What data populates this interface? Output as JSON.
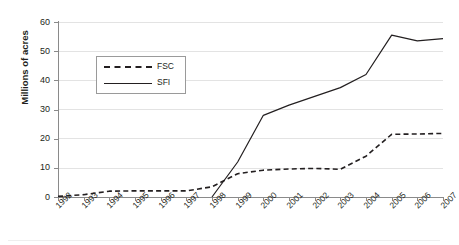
{
  "chart_data": {
    "type": "line",
    "title": "",
    "xlabel": "",
    "ylabel": "Millions of acres",
    "ylim": [
      0,
      60
    ],
    "yticks": [
      0,
      10,
      20,
      30,
      40,
      50,
      60
    ],
    "grid": true,
    "legend_position": "inside-upper-left",
    "categories": [
      "1992",
      "1993",
      "1994",
      "1995",
      "1996",
      "1997",
      "1998",
      "1999",
      "2000",
      "2001",
      "2002",
      "2003",
      "2004",
      "2005",
      "2006",
      "2007"
    ],
    "series": [
      {
        "name": "FSC",
        "style": "dashed",
        "color": "#231f20",
        "values": [
          0.2,
          0.8,
          2.0,
          2.1,
          2.1,
          2.1,
          3.5,
          8.0,
          9.2,
          9.6,
          9.8,
          9.5,
          14.0,
          21.5,
          21.6,
          21.8
        ]
      },
      {
        "name": "SFI",
        "style": "solid",
        "color": "#231f20",
        "values": [
          null,
          null,
          null,
          null,
          null,
          null,
          0.0,
          12.0,
          28.0,
          31.5,
          34.5,
          37.5,
          42.0,
          55.5,
          53.5,
          54.3
        ]
      }
    ]
  },
  "axis": {
    "y_title": "Millions of acres",
    "y_tick_labels": [
      "0",
      "10",
      "20",
      "30",
      "40",
      "50",
      "60"
    ],
    "x_tick_labels": [
      "1992",
      "1993",
      "1994",
      "1995",
      "1996",
      "1997",
      "1998",
      "1999",
      "2000",
      "2001",
      "2002",
      "2003",
      "2004",
      "2005",
      "2006",
      "2007"
    ]
  },
  "legend": {
    "items": [
      {
        "label": "FSC",
        "style": "dashed"
      },
      {
        "label": "SFI",
        "style": "solid"
      }
    ]
  }
}
